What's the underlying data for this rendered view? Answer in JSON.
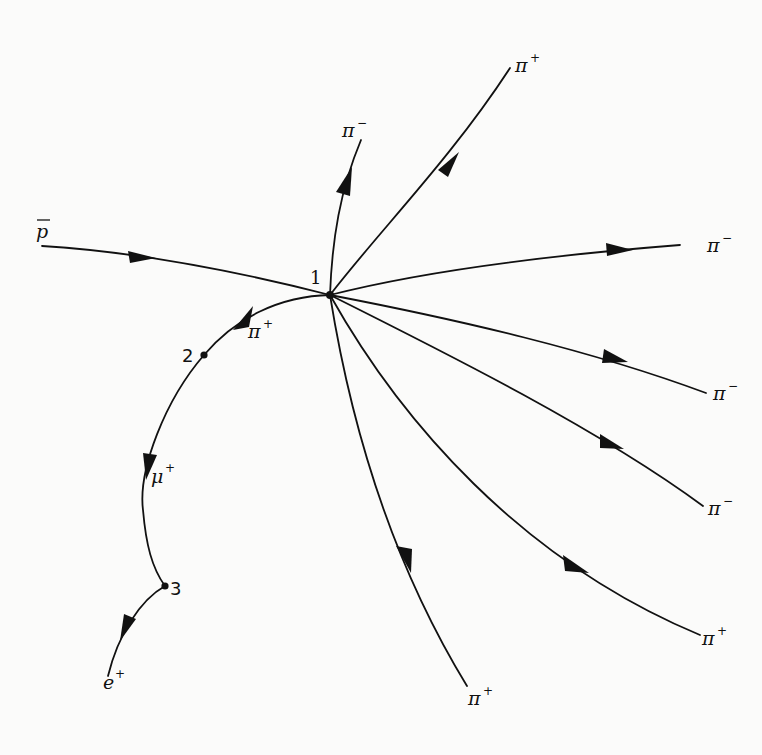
{
  "diagram": {
    "type": "particle-tracks",
    "colors": {
      "ink": "#111111",
      "background": "#fbfbfa"
    },
    "vertices": [
      {
        "id": "1",
        "label": "1"
      },
      {
        "id": "2",
        "label": "2"
      },
      {
        "id": "3",
        "label": "3"
      }
    ],
    "tracks": [
      {
        "id": "antiproton",
        "particle": "p",
        "bar": true,
        "superscript": "",
        "from": "start",
        "to": "vertex-1"
      },
      {
        "id": "pi-minus-up",
        "particle": "π",
        "superscript": "−",
        "from": "vertex-1"
      },
      {
        "id": "pi-plus-up-right",
        "particle": "π",
        "superscript": "+",
        "from": "vertex-1"
      },
      {
        "id": "pi-minus-right",
        "particle": "π",
        "superscript": "−",
        "from": "vertex-1"
      },
      {
        "id": "pi-minus-right-2",
        "particle": "π",
        "superscript": "−",
        "from": "vertex-1"
      },
      {
        "id": "pi-minus-right-3",
        "particle": "π",
        "superscript": "−",
        "from": "vertex-1"
      },
      {
        "id": "pi-plus-lower-right",
        "particle": "π",
        "superscript": "+",
        "from": "vertex-1"
      },
      {
        "id": "pi-plus-down",
        "particle": "π",
        "superscript": "+",
        "from": "vertex-1"
      },
      {
        "id": "pi-plus-to-vertex-2",
        "particle": "π",
        "superscript": "+",
        "from": "vertex-1",
        "to": "vertex-2"
      },
      {
        "id": "muon",
        "particle": "μ",
        "superscript": "+",
        "from": "vertex-2",
        "to": "vertex-3"
      },
      {
        "id": "positron",
        "particle": "e",
        "superscript": "+",
        "from": "vertex-3"
      }
    ]
  }
}
